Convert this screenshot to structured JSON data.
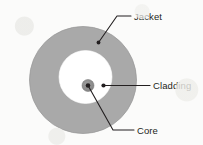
{
  "diagram": {
    "background_color": "#fbfbfa",
    "line_color": "#231f20",
    "layers": [
      {
        "id": "jacket",
        "label": "Jacket",
        "shape": "ring",
        "fill_color": "#a8a8a8",
        "stroke_color": "#8f8f8f",
        "center": {
          "x": 83,
          "y": 80
        },
        "radius": 54
      },
      {
        "id": "cladding",
        "label": "Cladding",
        "shape": "circle",
        "fill_color": "#ffffff",
        "stroke_color": "#ffffff",
        "center": {
          "x": 85,
          "y": 77
        },
        "radius": 27
      },
      {
        "id": "core",
        "label": "Core",
        "shape": "circle",
        "fill_color": "#8c8c8c",
        "stroke_color": "#7a7a7a",
        "center": {
          "x": 88,
          "y": 85
        },
        "radius": 6
      }
    ],
    "callouts": [
      {
        "id": "jacket-callout",
        "label": "Jacket",
        "anchor_dot": {
          "x": 98,
          "y": 42
        },
        "elbow": {
          "x": 117,
          "y": 16
        },
        "line_end": {
          "x": 131,
          "y": 16
        },
        "text_position": {
          "x": 134,
          "y": 19.5
        }
      },
      {
        "id": "cladding-callout",
        "label": "Cladding",
        "anchor_dot": {
          "x": 103,
          "y": 85
        },
        "elbow": {
          "x": 103,
          "y": 85
        },
        "line_end": {
          "x": 150,
          "y": 85
        },
        "text_position": {
          "x": 153,
          "y": 88.5
        }
      },
      {
        "id": "core-callout",
        "label": "Core",
        "anchor_dot": {
          "x": 88,
          "y": 85
        },
        "elbow": {
          "x": 113,
          "y": 130
        },
        "line_end": {
          "x": 134,
          "y": 130
        },
        "text_position": {
          "x": 137,
          "y": 133.5
        }
      }
    ]
  }
}
